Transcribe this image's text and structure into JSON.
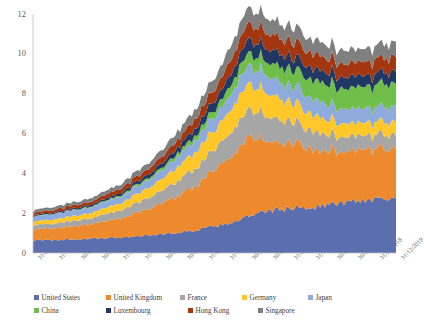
{
  "chart_data": {
    "type": "area",
    "stacked": true,
    "title": "",
    "xlabel": "",
    "ylabel": "",
    "ylim": [
      0,
      12
    ],
    "yticks": [
      0,
      2,
      4,
      6,
      8,
      10,
      12
    ],
    "grid": false,
    "legend_position": "bottom",
    "categories": [
      "31/03/1990",
      "31/12/1991",
      "30/09/1993",
      "30/06/1995",
      "31/03/1997",
      "31/12/1998",
      "30/09/2000",
      "30/06/2002",
      "31/03/2004",
      "31/12/2005",
      "30/09/2007",
      "30/06/2009",
      "31/03/2011",
      "31/12/2012",
      "30/09/2014",
      "30/06/2016",
      "31/03/2018",
      "31/12/2019"
    ],
    "series": [
      {
        "name": "United States",
        "color": "#5B6FAE",
        "values": [
          0.62,
          0.66,
          0.7,
          0.72,
          0.78,
          0.85,
          0.95,
          1.05,
          1.22,
          1.45,
          1.8,
          2.1,
          2.25,
          2.3,
          2.45,
          2.6,
          2.72,
          2.85
        ]
      },
      {
        "name": "United Kingdom",
        "color": "#ED8A2E",
        "values": [
          0.52,
          0.58,
          0.66,
          0.76,
          0.95,
          1.2,
          1.55,
          1.95,
          2.45,
          3.1,
          3.95,
          3.6,
          3.3,
          2.95,
          2.7,
          2.55,
          2.5,
          2.55
        ]
      },
      {
        "name": "France",
        "color": "#A6A6A6",
        "values": [
          0.22,
          0.24,
          0.28,
          0.32,
          0.4,
          0.5,
          0.62,
          0.78,
          0.95,
          1.15,
          1.4,
          1.25,
          1.1,
          0.95,
          0.8,
          0.72,
          0.68,
          0.7
        ]
      },
      {
        "name": "Germany",
        "color": "#FFC728",
        "values": [
          0.18,
          0.2,
          0.24,
          0.28,
          0.36,
          0.46,
          0.58,
          0.72,
          0.88,
          1.05,
          1.3,
          1.15,
          1.0,
          0.85,
          0.72,
          0.65,
          0.62,
          0.64
        ]
      },
      {
        "name": "Japan",
        "color": "#8FAADC",
        "values": [
          0.26,
          0.27,
          0.28,
          0.3,
          0.33,
          0.38,
          0.44,
          0.52,
          0.62,
          0.74,
          0.92,
          0.88,
          0.85,
          0.8,
          0.76,
          0.74,
          0.74,
          0.78
        ]
      },
      {
        "name": "China",
        "color": "#6FBE4A",
        "values": [
          0.02,
          0.02,
          0.03,
          0.04,
          0.06,
          0.09,
          0.13,
          0.19,
          0.28,
          0.42,
          0.62,
          0.68,
          0.82,
          0.92,
          1.02,
          1.08,
          1.12,
          1.16
        ]
      },
      {
        "name": "Luxembourg",
        "color": "#1F3864",
        "values": [
          0.05,
          0.06,
          0.07,
          0.09,
          0.12,
          0.16,
          0.22,
          0.3,
          0.4,
          0.52,
          0.68,
          0.66,
          0.64,
          0.6,
          0.58,
          0.56,
          0.56,
          0.58
        ]
      },
      {
        "name": "Hong Kong",
        "color": "#A3360F",
        "values": [
          0.12,
          0.13,
          0.15,
          0.17,
          0.21,
          0.26,
          0.33,
          0.41,
          0.52,
          0.65,
          0.82,
          0.78,
          0.76,
          0.72,
          0.7,
          0.68,
          0.7,
          0.74
        ]
      },
      {
        "name": "Singapore",
        "color": "#7F7F7F",
        "values": [
          0.14,
          0.15,
          0.16,
          0.18,
          0.22,
          0.27,
          0.34,
          0.42,
          0.52,
          0.64,
          0.8,
          0.76,
          0.74,
          0.7,
          0.68,
          0.66,
          0.68,
          0.72
        ]
      }
    ]
  },
  "legend": {
    "row1": [
      "United States",
      "United Kingdom",
      "France",
      "Germany",
      "Japan"
    ],
    "row2": [
      "China",
      "Luxembourg",
      "Hong Kong",
      "Singapore"
    ]
  }
}
